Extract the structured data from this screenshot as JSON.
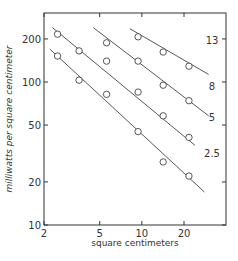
{
  "chart_data": {
    "type": "scatter",
    "title": "",
    "xlabel": "square centimeters",
    "ylabel": "milliwatts per square centimeter",
    "xscale": "log",
    "yscale": "log",
    "xlim": [
      2,
      40
    ],
    "ylim": [
      10,
      300
    ],
    "grid": false,
    "x_ticks": [
      "2",
      "5",
      "10",
      "20"
    ],
    "y_ticks": [
      "10",
      "20",
      "50",
      "100",
      "200"
    ],
    "series": [
      {
        "name": "13",
        "points": [
          [
            9.4,
            207
          ],
          [
            14.2,
            162
          ],
          [
            21.7,
            129
          ]
        ],
        "line": [
          [
            8.2,
            236
          ],
          [
            30,
            113
          ]
        ]
      },
      {
        "name": "8",
        "points": [
          [
            5.6,
            188
          ],
          [
            9.4,
            140
          ],
          [
            14.2,
            95
          ],
          [
            21.7,
            74
          ]
        ],
        "line": [
          [
            4.5,
            240
          ],
          [
            30,
            58
          ]
        ]
      },
      {
        "name": "5",
        "points": [
          [
            2.5,
            216
          ],
          [
            3.56,
            165
          ],
          [
            5.6,
            140
          ],
          [
            9.4,
            85
          ],
          [
            14.2,
            58
          ],
          [
            21.7,
            41
          ]
        ],
        "line": [
          [
            2.3,
            240
          ],
          [
            24,
            36
          ]
        ]
      },
      {
        "name": "2.5",
        "points": [
          [
            2.5,
            152
          ],
          [
            3.56,
            103
          ],
          [
            5.6,
            82
          ],
          [
            9.4,
            45
          ],
          [
            14.2,
            27.6
          ],
          [
            21.7,
            22
          ]
        ],
        "line": [
          [
            2.2,
            170
          ],
          [
            28,
            17
          ]
        ]
      }
    ],
    "series_labels": [
      "13",
      "8",
      "5",
      "2.5"
    ]
  }
}
